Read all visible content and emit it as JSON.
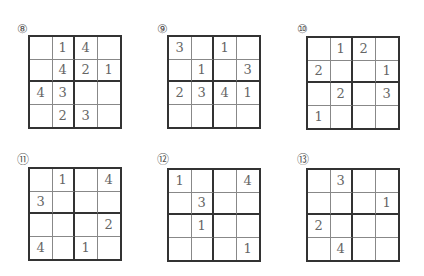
{
  "puzzles": [
    {
      "label": "⑧",
      "x": 17,
      "y": 22,
      "gx": 28,
      "gy": 35,
      "cells": [
        [
          "",
          "1",
          "4",
          ""
        ],
        [
          "",
          "4",
          "2",
          "1"
        ],
        [
          "4",
          "3",
          "",
          ""
        ],
        [
          "",
          "2",
          "3",
          ""
        ]
      ]
    },
    {
      "label": "⑨",
      "x": 157,
      "y": 22,
      "gx": 167,
      "gy": 35,
      "cells": [
        [
          "3",
          "",
          "1",
          ""
        ],
        [
          "",
          "1",
          "",
          "3"
        ],
        [
          "2",
          "3",
          "4",
          "1"
        ],
        [
          "",
          "",
          "",
          ""
        ]
      ]
    },
    {
      "label": "⑩",
      "x": 297,
      "y": 22,
      "gx": 306,
      "gy": 36,
      "cells": [
        [
          "",
          "1",
          "2",
          ""
        ],
        [
          "2",
          "",
          "",
          "1"
        ],
        [
          "",
          "2",
          "",
          "3"
        ],
        [
          "1",
          "",
          "",
          ""
        ]
      ]
    },
    {
      "label": "⑪",
      "x": 17,
      "y": 153,
      "gx": 28,
      "gy": 167,
      "cells": [
        [
          "",
          "1",
          "",
          "4"
        ],
        [
          "3",
          "",
          "",
          ""
        ],
        [
          "",
          "",
          "",
          "2"
        ],
        [
          "4",
          "",
          "1",
          ""
        ]
      ]
    },
    {
      "label": "⑫",
      "x": 157,
      "y": 153,
      "gx": 167,
      "gy": 168,
      "cells": [
        [
          "1",
          "",
          "",
          "4"
        ],
        [
          "",
          "3",
          "",
          ""
        ],
        [
          "",
          "1",
          "",
          ""
        ],
        [
          "",
          "",
          "",
          "1"
        ]
      ]
    },
    {
      "label": "⑬",
      "x": 297,
      "y": 153,
      "gx": 306,
      "gy": 168,
      "cells": [
        [
          "",
          "3",
          "",
          ""
        ],
        [
          "",
          "",
          "",
          "1"
        ],
        [
          "2",
          "",
          "",
          ""
        ],
        [
          "",
          "4",
          "",
          ""
        ]
      ]
    }
  ]
}
